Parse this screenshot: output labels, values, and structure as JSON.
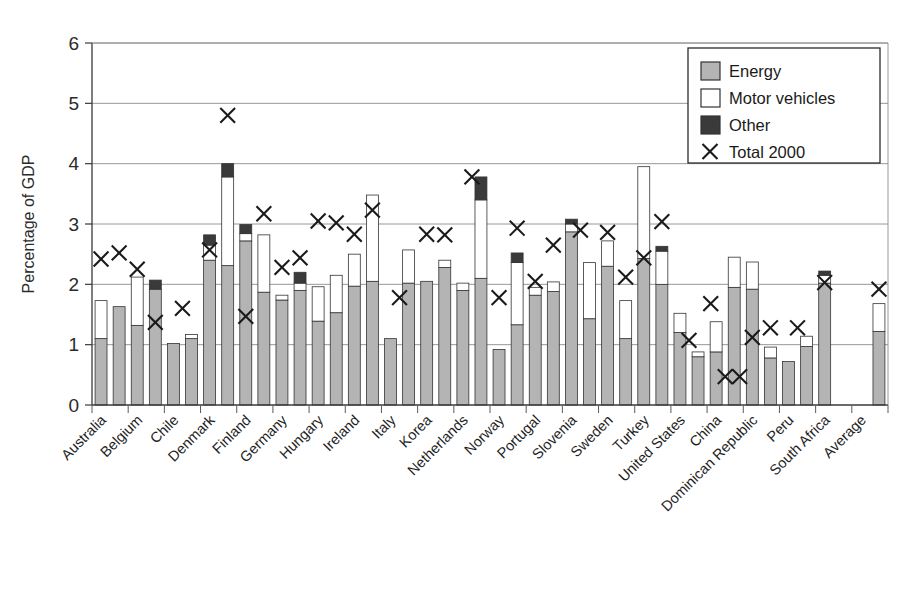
{
  "chart_data": {
    "type": "bar",
    "title": "",
    "subtitle": "",
    "xlabel": "",
    "ylabel": "Percentage of GDP",
    "ylim": [
      0,
      6
    ],
    "yticks": [
      0,
      1,
      2,
      3,
      4,
      5,
      6
    ],
    "ytick_labels": [
      "0",
      "1",
      "2",
      "3",
      "4",
      "5",
      "6"
    ],
    "grid": true,
    "stacked": true,
    "bars_per_category": 2,
    "legend_position": "top-right",
    "legend": [
      "Energy",
      "Motor vehicles",
      "Other",
      "Total 2000"
    ],
    "series": [
      {
        "name": "Energy",
        "color": "#b4b4b4",
        "swatch": "gray"
      },
      {
        "name": "Motor vehicles",
        "color": "#ffffff",
        "swatch": "white"
      },
      {
        "name": "Other",
        "color": "#3a3a3a",
        "swatch": "dark"
      }
    ],
    "marker_series": {
      "name": "Total 2000",
      "symbol": "X"
    },
    "categories": [
      "Australia",
      "Belgium",
      "Chile",
      "Denmark",
      "Finland",
      "Germany",
      "Hungary",
      "Ireland",
      "Italy",
      "Korea",
      "Netherlands",
      "Norway",
      "Portugal",
      "Slovenia",
      "Sweden",
      "Turkey",
      "United States",
      "China",
      "Dominican Republic",
      "Peru",
      "South Africa",
      "Average"
    ],
    "data": [
      {
        "category": "Australia",
        "bars": [
          {
            "energy": 1.1,
            "motor": 0.63,
            "other": 0.0,
            "total": 1.73
          },
          {
            "energy": 1.63,
            "motor": 0.0,
            "other": 0.0,
            "total": 1.63
          }
        ],
        "markers": [
          2.42,
          2.52
        ]
      },
      {
        "category": "Belgium",
        "bars": [
          {
            "energy": 1.32,
            "motor": 0.8,
            "other": 0.0,
            "total": 2.12
          },
          {
            "energy": 1.92,
            "motor": 0.0,
            "other": 0.15,
            "total": 2.07
          }
        ],
        "markers": [
          2.25,
          1.37
        ]
      },
      {
        "category": "Chile",
        "bars": [
          {
            "energy": 1.02,
            "motor": 0.0,
            "other": 0.0,
            "total": 1.02
          },
          {
            "energy": 1.1,
            "motor": 0.07,
            "other": 0.0,
            "total": 1.17
          }
        ],
        "markers": [
          1.6
        ]
      },
      {
        "category": "Denmark",
        "bars": [
          {
            "energy": 2.4,
            "motor": 0.25,
            "other": 0.17,
            "total": 2.82
          },
          {
            "energy": 2.31,
            "motor": 1.47,
            "other": 0.22,
            "total": 4.0
          }
        ],
        "markers": [
          2.57,
          4.8
        ]
      },
      {
        "category": "Finland",
        "bars": [
          {
            "energy": 2.72,
            "motor": 0.12,
            "other": 0.15,
            "total": 2.99
          },
          {
            "energy": 1.87,
            "motor": 0.95,
            "other": 0.0,
            "total": 2.82
          }
        ],
        "markers": [
          1.47,
          3.17
        ]
      },
      {
        "category": "Germany",
        "bars": [
          {
            "energy": 1.74,
            "motor": 0.08,
            "other": 0.0,
            "total": 1.82
          },
          {
            "energy": 1.9,
            "motor": 0.12,
            "other": 0.18,
            "total": 2.2
          }
        ],
        "markers": [
          2.28,
          2.44
        ]
      },
      {
        "category": "Hungary",
        "bars": [
          {
            "energy": 1.39,
            "motor": 0.57,
            "other": 0.0,
            "total": 1.96
          },
          {
            "energy": 1.53,
            "motor": 0.62,
            "other": 0.0,
            "total": 2.15
          }
        ],
        "markers": [
          3.05,
          3.02
        ]
      },
      {
        "category": "Ireland",
        "bars": [
          {
            "energy": 1.97,
            "motor": 0.53,
            "other": 0.0,
            "total": 2.5
          },
          {
            "energy": 2.05,
            "motor": 1.43,
            "other": 0.0,
            "total": 3.48
          }
        ],
        "markers": [
          2.83,
          3.23
        ]
      },
      {
        "category": "Italy",
        "bars": [
          {
            "energy": 1.1,
            "motor": 0.0,
            "other": 0.0,
            "total": 1.1
          },
          {
            "energy": 2.02,
            "motor": 0.55,
            "other": 0.0,
            "total": 2.57
          }
        ],
        "markers": [
          1.78
        ]
      },
      {
        "category": "Korea",
        "bars": [
          {
            "energy": 2.05,
            "motor": 0.0,
            "other": 0.0,
            "total": 2.05
          },
          {
            "energy": 2.28,
            "motor": 0.12,
            "other": 0.0,
            "total": 2.4
          }
        ],
        "markers": [
          2.83,
          2.82
        ]
      },
      {
        "category": "Netherlands",
        "bars": [
          {
            "energy": 1.9,
            "motor": 0.12,
            "other": 0.0,
            "total": 2.02
          },
          {
            "energy": 2.1,
            "motor": 1.3,
            "other": 0.38,
            "total": 3.78
          }
        ],
        "markers": [
          3.78
        ]
      },
      {
        "category": "Norway",
        "bars": [
          {
            "energy": 0.92,
            "motor": 0.0,
            "other": 0.0,
            "total": 0.92
          },
          {
            "energy": 1.33,
            "motor": 1.03,
            "other": 0.16,
            "total": 2.52
          }
        ],
        "markers": [
          1.78,
          2.93
        ]
      },
      {
        "category": "Portugal",
        "bars": [
          {
            "energy": 1.82,
            "motor": 0.13,
            "other": 0.0,
            "total": 1.95
          },
          {
            "energy": 1.88,
            "motor": 0.16,
            "other": 0.0,
            "total": 2.04
          }
        ],
        "markers": [
          2.05,
          2.65
        ]
      },
      {
        "category": "Slovenia",
        "bars": [
          {
            "energy": 2.87,
            "motor": 0.13,
            "other": 0.08,
            "total": 3.08
          },
          {
            "energy": 1.43,
            "motor": 0.93,
            "other": 0.0,
            "total": 2.36
          }
        ],
        "markers": [
          2.9
        ]
      },
      {
        "category": "Sweden",
        "bars": [
          {
            "energy": 2.3,
            "motor": 0.42,
            "other": 0.0,
            "total": 2.72
          },
          {
            "energy": 1.1,
            "motor": 0.63,
            "other": 0.0,
            "total": 1.73
          }
        ],
        "markers": [
          2.86,
          2.12
        ]
      },
      {
        "category": "Turkey",
        "bars": [
          {
            "energy": 2.43,
            "motor": 1.52,
            "other": 0.0,
            "total": 3.95
          },
          {
            "energy": 2.0,
            "motor": 0.55,
            "other": 0.08,
            "total": 2.63
          }
        ],
        "markers": [
          2.44,
          3.04
        ]
      },
      {
        "category": "United States",
        "bars": [
          {
            "energy": 1.2,
            "motor": 0.32,
            "other": 0.0,
            "total": 1.52
          },
          {
            "energy": 0.8,
            "motor": 0.08,
            "other": 0.0,
            "total": 0.88
          }
        ],
        "markers": [
          1.07
        ]
      },
      {
        "category": "China",
        "bars": [
          {
            "energy": 0.88,
            "motor": 0.5,
            "other": 0.0,
            "total": 1.38
          },
          {
            "energy": 1.95,
            "motor": 0.5,
            "other": 0.0,
            "total": 2.45
          }
        ],
        "markers": [
          1.68,
          0.47,
          0.47
        ]
      },
      {
        "category": "Dominican Republic",
        "bars": [
          {
            "energy": 1.92,
            "motor": 0.45,
            "other": 0.0,
            "total": 2.37
          },
          {
            "energy": 0.78,
            "motor": 0.18,
            "other": 0.0,
            "total": 0.96
          }
        ],
        "markers": [
          1.12,
          1.28
        ]
      },
      {
        "category": "Peru",
        "bars": [
          {
            "energy": 0.72,
            "motor": 0.0,
            "other": 0.0,
            "total": 0.72
          },
          {
            "energy": 0.97,
            "motor": 0.17,
            "other": 0.0,
            "total": 1.14
          }
        ],
        "markers": [
          1.28
        ]
      },
      {
        "category": "South Africa",
        "bars": [
          {
            "energy": 2.02,
            "motor": 0.13,
            "other": 0.07,
            "total": 2.22
          },
          null
        ],
        "markers": [
          2.03
        ]
      },
      {
        "category": "Average",
        "bars": [
          null,
          {
            "energy": 1.22,
            "motor": 0.46,
            "other": 0.0,
            "total": 1.68
          }
        ],
        "markers": [
          1.92
        ]
      }
    ]
  },
  "legend": {
    "items": [
      {
        "label": "Energy",
        "swatch": "gray"
      },
      {
        "label": "Motor vehicles",
        "swatch": "white"
      },
      {
        "label": "Other",
        "swatch": "dark"
      },
      {
        "label": "Total 2000",
        "swatch": "x-marker"
      }
    ]
  },
  "colors": {
    "energy": "#b4b4b4",
    "motor": "#ffffff",
    "other": "#3a3a3a",
    "outline": "#333333",
    "axis": "#3a3a3a",
    "grid": "#8c8c8c",
    "marker": "#1a1a1a"
  }
}
